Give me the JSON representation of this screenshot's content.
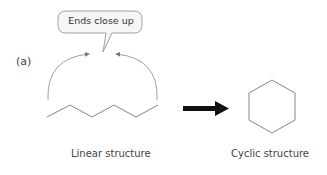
{
  "figure": {
    "panel_label": "(a)",
    "callout": "Ends close up",
    "left_label": "Linear structure",
    "right_label": "Cyclic structure",
    "colors": {
      "line": "#7a7a7a",
      "arrow": "#111111",
      "callout_border": "#8a8a8a",
      "callout_fill": "#f6f6f6"
    }
  }
}
